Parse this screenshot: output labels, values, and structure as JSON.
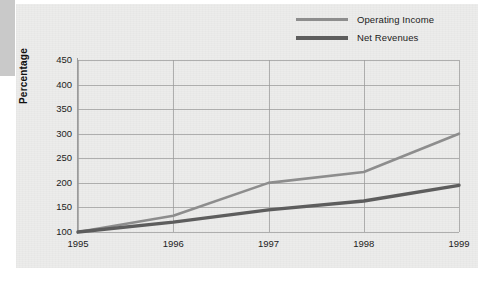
{
  "legend": {
    "position": "top-right",
    "entries": [
      {
        "label": "Operating Income",
        "color": "#8d8d8d",
        "swatch": "legend-line-operating-income"
      },
      {
        "label": "Net Revenues",
        "color": "#5d5d5d",
        "swatch": "legend-line-net-revenues"
      }
    ]
  },
  "axes": {
    "ylabel": "Percentage",
    "yticks": [
      "450",
      "400",
      "350",
      "300",
      "250",
      "200",
      "150",
      "100"
    ],
    "xticks": [
      "1995",
      "1996",
      "1997",
      "1998",
      "1999"
    ]
  },
  "chart_data": {
    "type": "line",
    "title": "",
    "xlabel": "",
    "ylabel": "Percentage",
    "categories": [
      "1995",
      "1996",
      "1997",
      "1998",
      "1999"
    ],
    "x": [
      1995,
      1996,
      1997,
      1998,
      1999
    ],
    "series": [
      {
        "name": "Operating Income",
        "color": "#8d8d8d",
        "values": [
          100,
          133,
          200,
          222,
          300
        ]
      },
      {
        "name": "Net Revenues",
        "color": "#5d5d5d",
        "values": [
          100,
          120,
          145,
          163,
          195
        ]
      }
    ],
    "ylim": [
      100,
      450
    ],
    "ytick_step": 50,
    "grid": true,
    "legend_position": "top-right"
  },
  "colors": {
    "panel_background": "#ececeb",
    "page_background": "#ffffff",
    "grid": "#9a9a9a",
    "corner_block": "#c9c9c9",
    "text": "#1c1c1c"
  }
}
